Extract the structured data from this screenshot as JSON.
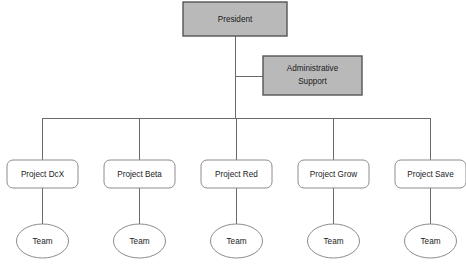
{
  "diagram": {
    "type": "organization-chart",
    "background_color": "#ffffff",
    "colors": {
      "executive_fill": "#b9b9b9",
      "executive_border": "#555555",
      "unit_fill": "#ffffff",
      "unit_border": "#8c8c8c",
      "team_fill": "#ffffff",
      "team_border": "#8c8c8c",
      "connector": "#6a6a6a",
      "text": "#1b1b1b"
    }
  },
  "nodes": {
    "president": {
      "label": "President",
      "shape": "rectangle",
      "fill": "#b9b9b9",
      "x": 183,
      "y": 2,
      "width": 104,
      "height": 34
    },
    "administrative_support": {
      "label_line_1": "Administrative",
      "label_line_2": "Support",
      "shape": "rectangle",
      "fill": "#b9b9b9",
      "x": 263,
      "y": 56,
      "width": 99,
      "height": 39
    }
  },
  "projects": [
    {
      "label": "Project DcX",
      "team_label": "Team",
      "x": 7,
      "center_x": 42
    },
    {
      "label": "Project Beta",
      "team_label": "Team",
      "x": 104,
      "center_x": 139
    },
    {
      "label": "Project Red",
      "team_label": "Team",
      "x": 201,
      "center_x": 236
    },
    {
      "label": "Project Grow",
      "team_label": "Team",
      "x": 298,
      "center_x": 333
    },
    {
      "label": "Project Save",
      "team_label": "Team",
      "x": 395,
      "center_x": 430
    }
  ],
  "layout": {
    "project_box_width": 71,
    "project_box_height": 28,
    "project_box_y": 160,
    "project_box_radius": 6,
    "team_ellipse_rx": 26,
    "team_ellipse_ry": 17,
    "team_ellipse_cy": 241,
    "bus_y": 118,
    "bus_x_start": 42,
    "bus_x_end": 430,
    "trunk_x": 235,
    "admin_stub_y": 76
  }
}
